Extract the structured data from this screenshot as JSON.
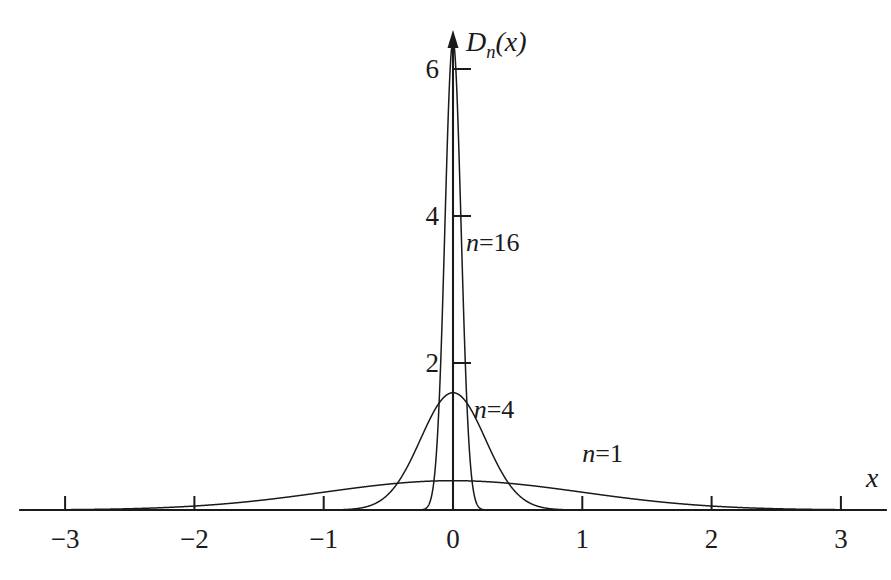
{
  "chart_data": {
    "type": "line",
    "title": "",
    "subtitle": "",
    "xlabel": "x",
    "ylabel": "D_n(x)",
    "xlim": [
      -3.35,
      3.35
    ],
    "ylim": [
      0,
      6.8
    ],
    "grid": false,
    "legend_position": "inline-annotations",
    "x_ticks": [
      {
        "value": -3,
        "label": "−3"
      },
      {
        "value": -2,
        "label": "−2"
      },
      {
        "value": -1,
        "label": "−1"
      },
      {
        "value": 0,
        "label": "0"
      },
      {
        "value": 1,
        "label": "1"
      },
      {
        "value": 2,
        "label": "2"
      },
      {
        "value": 3,
        "label": "3"
      }
    ],
    "y_ticks": [
      {
        "value": 2,
        "label": "2"
      },
      {
        "value": 4,
        "label": "4"
      },
      {
        "value": 6,
        "label": "6"
      }
    ],
    "formula": "D_n(x) = (n / sqrt(2*pi)) * exp(-n^2 * x^2 / 2)",
    "series": [
      {
        "name": "n=1",
        "n": 1,
        "peak_value": 0.4,
        "color": "#1a1a1a",
        "label": "n=1",
        "label_x": 1.0,
        "label_y": 0.73
      },
      {
        "name": "n=4",
        "n": 4,
        "peak_value": 1.6,
        "color": "#1a1a1a",
        "label": "n=4",
        "label_x": 0.16,
        "label_y": 1.33
      },
      {
        "name": "n=16",
        "n": 16,
        "peak_value": 6.4,
        "color": "#1a1a1a",
        "label": "n=16",
        "label_x": 0.1,
        "label_y": 3.6
      }
    ],
    "annotations": [
      {
        "text": "n=16",
        "kind": "curve-label"
      },
      {
        "text": "n=4",
        "kind": "curve-label"
      },
      {
        "text": "n=1",
        "kind": "curve-label"
      }
    ]
  },
  "axes": {
    "x_axis_name": "x",
    "y_axis_name": "D",
    "y_axis_subscript": "n",
    "y_axis_arg": "(x)",
    "axis_color": "#1a1a1a"
  }
}
